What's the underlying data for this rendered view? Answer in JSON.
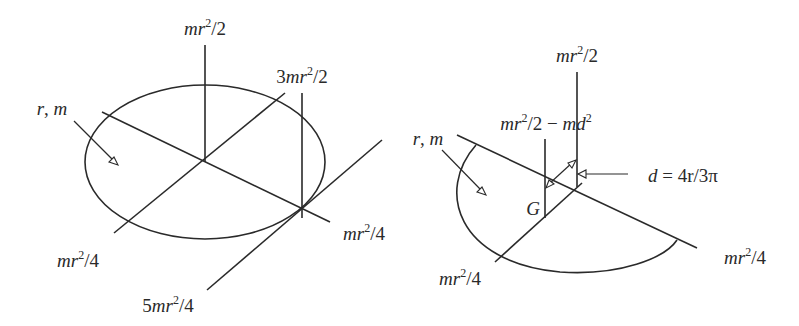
{
  "figure": {
    "colors": {
      "ink": "#2a2a2a",
      "background": "#ffffff"
    },
    "disk": {
      "body_label": {
        "var1": "r",
        "sep": ",",
        "var2": "m"
      },
      "labels": {
        "axial_center": {
          "coef": "",
          "v1": "m",
          "v2": "r",
          "exp": "2",
          "den": "/2"
        },
        "axial_edge": {
          "coef": "3",
          "v1": "m",
          "v2": "r",
          "exp": "2",
          "den": "/2"
        },
        "diameter_a": {
          "coef": "",
          "v1": "m",
          "v2": "r",
          "exp": "2",
          "den": "/4"
        },
        "diameter_b": {
          "coef": "",
          "v1": "m",
          "v2": "r",
          "exp": "2",
          "den": "/4"
        },
        "tangent": {
          "coef": "5",
          "v1": "m",
          "v2": "r",
          "exp": "2",
          "den": "/4"
        }
      }
    },
    "half_disk": {
      "body_label": {
        "var1": "r",
        "sep": ",",
        "var2": "m"
      },
      "centroid": "G",
      "offset": {
        "lhs": "d",
        "eq": " = ",
        "rhs": "4r/3π"
      },
      "labels": {
        "axial_center": {
          "coef": "",
          "v1": "m",
          "v2": "r",
          "exp": "2",
          "den": "/2"
        },
        "axial_centroid": {
          "v1": "m",
          "v2": "r",
          "exp": "2",
          "mid": "/2 − ",
          "v3": "m",
          "v4": "d",
          "exp2": "2"
        },
        "diameter_edge": {
          "coef": "",
          "v1": "m",
          "v2": "r",
          "exp": "2",
          "den": "/4"
        },
        "symmetry_axis": {
          "coef": "",
          "v1": "m",
          "v2": "r",
          "exp": "2",
          "den": "/4"
        }
      }
    }
  }
}
